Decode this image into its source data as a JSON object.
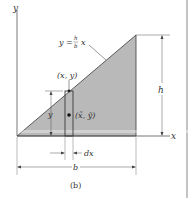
{
  "figure": {
    "caption": "(b)",
    "equation": {
      "lhs": "y =",
      "frac_num": "h",
      "frac_den": "b",
      "rhs": "x"
    },
    "labels": {
      "y_axis": "y",
      "x_axis": "x",
      "height": "h",
      "base": "b",
      "point": "(x, y)",
      "centroid": "(x̃, ỹ)",
      "strip_height": "y",
      "strip_width": "dx"
    },
    "colors": {
      "fill": "#b9b9b9",
      "line": "#3a3a3a",
      "dim_line": "#555555"
    }
  }
}
